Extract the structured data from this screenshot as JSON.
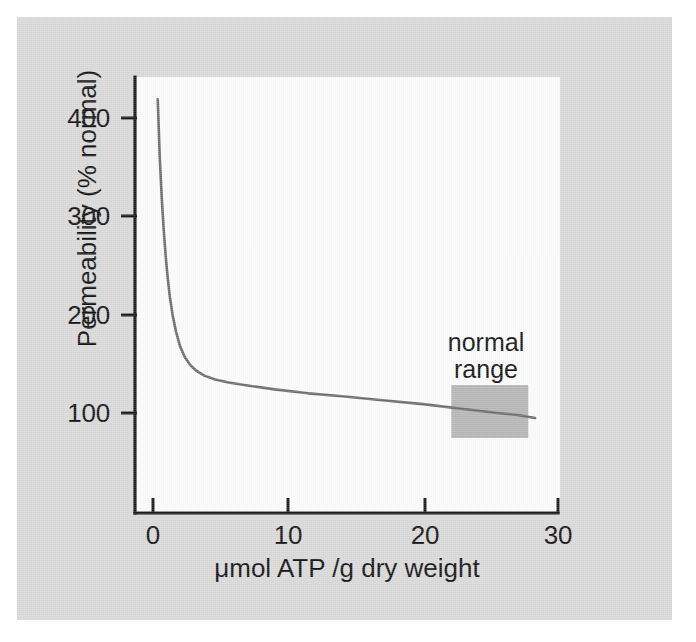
{
  "figure": {
    "background_color": "#d9d9d9",
    "plot_background_color": "#fbfbfb",
    "axis_color": "#1a1a1a",
    "curve_color": "#6e6e6e",
    "range_box_color": "#b6b6b6"
  },
  "chart_data": {
    "type": "line",
    "title": "",
    "subtitle": "",
    "xlabel": "μmol ATP /g dry weight",
    "ylabel": "Permeability (% normal)",
    "xlim": [
      0,
      30
    ],
    "ylim": [
      0,
      440
    ],
    "xticks": [
      0,
      10,
      20,
      30
    ],
    "xtick_labels": [
      "0",
      "10",
      "20",
      "30"
    ],
    "yticks": [
      100,
      200,
      300,
      400
    ],
    "ytick_labels": [
      "100",
      "200",
      "300",
      "400"
    ],
    "grid": false,
    "legend": null,
    "series": [
      {
        "name": "Permeability",
        "color": "#6e6e6e",
        "x": [
          0.35,
          0.4,
          0.5,
          0.65,
          0.8,
          0.95,
          1.1,
          1.25,
          1.45,
          1.7,
          2.0,
          2.35,
          2.75,
          3.2,
          3.8,
          4.6,
          5.6,
          7.0,
          9.0,
          11.5,
          14.0,
          17.0,
          20.0,
          23.0,
          25.5,
          27.0,
          28.3
        ],
        "y": [
          419,
          400,
          360,
          318,
          285,
          258,
          236,
          218,
          200,
          183,
          168,
          157,
          149,
          143,
          138,
          134,
          131,
          128,
          124,
          120,
          117,
          113,
          109,
          104,
          100,
          98,
          95
        ]
      }
    ],
    "annotations": [
      {
        "name": "normal-range",
        "text_line1": "normal",
        "text_line2": "range",
        "shape": "rectangle",
        "color": "#b6b6b6",
        "x_range": [
          22.1,
          27.8
        ],
        "y_range": [
          74.6,
          128.5
        ]
      }
    ]
  }
}
